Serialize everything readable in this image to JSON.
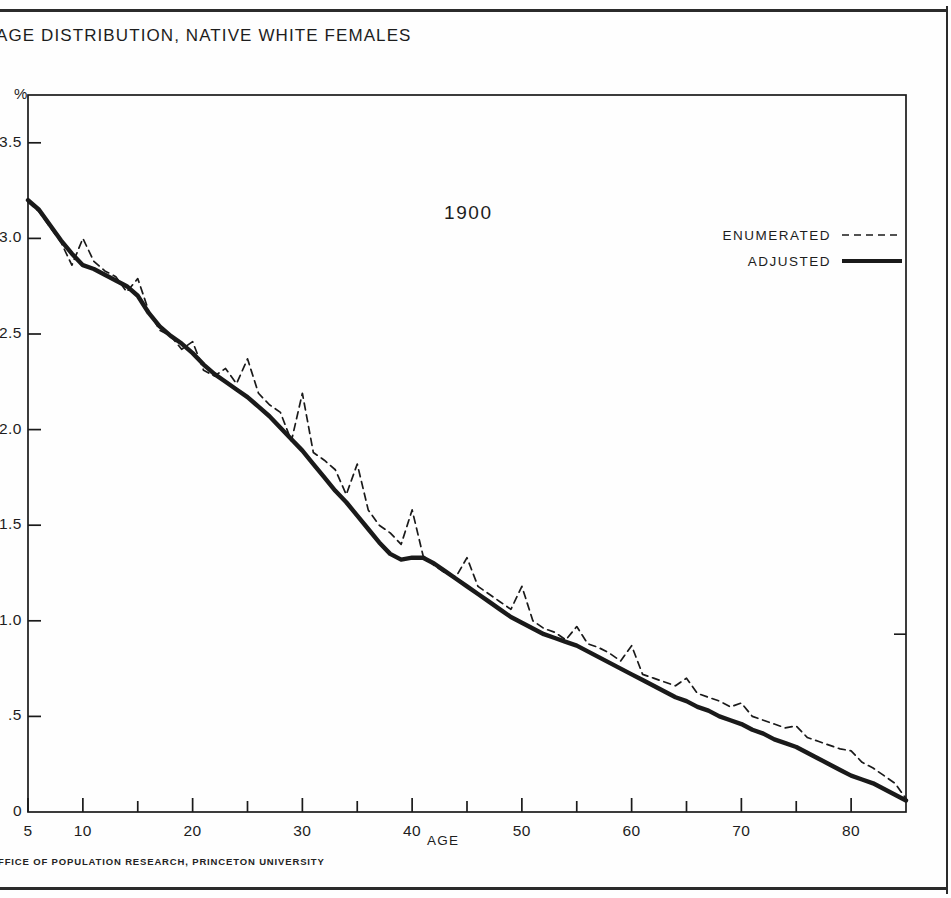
{
  "title": "AGE DISTRIBUTION, NATIVE WHITE FEMALES",
  "footer": "FFICE OF POPULATION RESEARCH, PRINCETON UNIVERSITY",
  "y_unit": "%",
  "x_axis_title": "AGE",
  "year_annotation": "1900",
  "legend": {
    "enumerated_label": "ENUMERATED",
    "adjusted_label": "ADJUSTED"
  },
  "colors": {
    "ink": "#1a1a1a",
    "frame": "#2b2b2b",
    "background": "#ffffff"
  },
  "chart_data": {
    "type": "line",
    "title": "AGE DISTRIBUTION, NATIVE WHITE FEMALES",
    "subtitle": "1900",
    "xlabel": "AGE",
    "ylabel": "%",
    "xlim": [
      5,
      85
    ],
    "ylim": [
      0,
      3.75
    ],
    "grid": false,
    "legend_position": "upper-right",
    "x_ticks_major": [
      5,
      10,
      20,
      30,
      40,
      50,
      60,
      70,
      80
    ],
    "x_ticks_minor": [
      15,
      25,
      35,
      45,
      55,
      65,
      75
    ],
    "x_tick_labels": [
      "5",
      "10",
      "20",
      "30",
      "40",
      "50",
      "60",
      "70",
      "80"
    ],
    "y_ticks": [
      0,
      0.5,
      1.0,
      1.5,
      2.0,
      2.5,
      3.0,
      3.5
    ],
    "y_tick_labels": [
      "0",
      ".5",
      "1.0",
      "1.5",
      "2.0",
      "2.5",
      "3.0",
      "3.5"
    ],
    "x": [
      5,
      6,
      7,
      8,
      9,
      10,
      11,
      12,
      13,
      14,
      15,
      16,
      17,
      18,
      19,
      20,
      21,
      22,
      23,
      24,
      25,
      26,
      27,
      28,
      29,
      30,
      31,
      32,
      33,
      34,
      35,
      36,
      37,
      38,
      39,
      40,
      41,
      42,
      43,
      44,
      45,
      46,
      47,
      48,
      49,
      50,
      51,
      52,
      53,
      54,
      55,
      56,
      57,
      58,
      59,
      60,
      61,
      62,
      63,
      64,
      65,
      66,
      67,
      68,
      69,
      70,
      71,
      72,
      73,
      74,
      75,
      76,
      77,
      78,
      79,
      80,
      81,
      82,
      83,
      84,
      85
    ],
    "series": [
      {
        "name": "ENUMERATED",
        "style": "dashed",
        "values": [
          3.19,
          3.14,
          3.06,
          2.98,
          2.86,
          3.0,
          2.88,
          2.83,
          2.8,
          2.72,
          2.79,
          2.62,
          2.52,
          2.49,
          2.42,
          2.46,
          2.31,
          2.28,
          2.32,
          2.24,
          2.37,
          2.19,
          2.13,
          2.09,
          1.94,
          2.19,
          1.88,
          1.84,
          1.79,
          1.66,
          1.82,
          1.58,
          1.5,
          1.46,
          1.4,
          1.58,
          1.34,
          1.29,
          1.25,
          1.23,
          1.33,
          1.18,
          1.14,
          1.1,
          1.06,
          1.18,
          1.0,
          0.96,
          0.94,
          0.9,
          0.97,
          0.88,
          0.86,
          0.83,
          0.79,
          0.87,
          0.72,
          0.7,
          0.68,
          0.66,
          0.7,
          0.62,
          0.6,
          0.58,
          0.55,
          0.57,
          0.5,
          0.48,
          0.46,
          0.44,
          0.45,
          0.39,
          0.37,
          0.35,
          0.33,
          0.32,
          0.26,
          0.23,
          0.19,
          0.15,
          0.07
        ]
      },
      {
        "name": "ADJUSTED",
        "style": "solid",
        "values": [
          3.2,
          3.15,
          3.07,
          2.99,
          2.92,
          2.86,
          2.84,
          2.81,
          2.78,
          2.75,
          2.7,
          2.61,
          2.54,
          2.49,
          2.45,
          2.4,
          2.34,
          2.29,
          2.25,
          2.21,
          2.17,
          2.12,
          2.07,
          2.01,
          1.95,
          1.89,
          1.82,
          1.75,
          1.68,
          1.62,
          1.55,
          1.48,
          1.41,
          1.35,
          1.32,
          1.33,
          1.33,
          1.3,
          1.26,
          1.22,
          1.18,
          1.14,
          1.1,
          1.06,
          1.02,
          0.99,
          0.96,
          0.93,
          0.91,
          0.89,
          0.87,
          0.84,
          0.81,
          0.78,
          0.75,
          0.72,
          0.69,
          0.66,
          0.63,
          0.6,
          0.58,
          0.55,
          0.53,
          0.5,
          0.48,
          0.46,
          0.43,
          0.41,
          0.38,
          0.36,
          0.34,
          0.31,
          0.28,
          0.25,
          0.22,
          0.19,
          0.17,
          0.15,
          0.12,
          0.09,
          0.06
        ]
      }
    ]
  }
}
